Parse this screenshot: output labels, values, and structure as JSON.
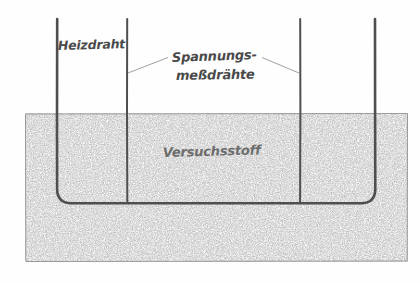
{
  "figure": {
    "background_color": "#fefefe",
    "ink_color": "#4f4f4f",
    "stipple_color": "#7a7a7a",
    "label_color": "#555555"
  },
  "labels": {
    "heating_wire": "Heizdraht",
    "voltage_wires_line1": "Spannungs-",
    "voltage_wires_line2": "meßdrähte",
    "test_material": "Versuchsstoff"
  },
  "diagram_data": {
    "type": "technical-cross-section",
    "region": {
      "name": "Versuchsstoff",
      "shape": "rectangle",
      "x": 25,
      "y": 113,
      "width": 383,
      "height": 149,
      "fill_pattern": "stipple"
    },
    "wires": [
      {
        "name": "Heizdraht-links",
        "kind": "heating",
        "x": 57,
        "top_y": 19,
        "bottom_y": 203
      },
      {
        "name": "Spannungsmessdraht-1",
        "kind": "voltage",
        "x": 127,
        "top_y": 19,
        "bottom_y": 203
      },
      {
        "name": "Spannungsmessdraht-2",
        "kind": "voltage",
        "x": 300,
        "top_y": 19,
        "bottom_y": 203
      },
      {
        "name": "Heizdraht-rechts",
        "kind": "heating",
        "x": 375,
        "top_y": 19,
        "bottom_y": 203
      }
    ],
    "heating_wire_path": {
      "description": "U-shaped loop, vertical legs at x=57 and x=375 joined by a horizontal run at y=203 with rounded corners",
      "corner_radius": 14,
      "bottom_y": 203
    },
    "leader_lines": [
      {
        "from_x": 127,
        "from_y": 73,
        "to_x": 168,
        "to_y": 58
      },
      {
        "from_x": 262,
        "from_y": 58,
        "to_x": 300,
        "to_y": 73
      }
    ],
    "label_positions": {
      "heating_wire": {
        "x": 58,
        "y": 50
      },
      "voltage_wires_line1": {
        "x": 172,
        "y": 62
      },
      "voltage_wires_line2": {
        "x": 176,
        "y": 80
      },
      "test_material": {
        "x": 163,
        "y": 157
      }
    }
  }
}
